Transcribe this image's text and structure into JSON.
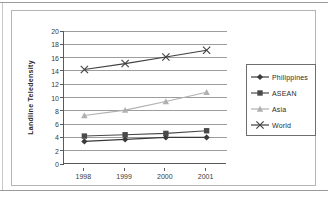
{
  "chart_data": {
    "type": "line",
    "title": "",
    "xlabel": "",
    "ylabel": "Landline Teledensity",
    "categories": [
      "1998",
      "1999",
      "2000",
      "2001"
    ],
    "ylim": [
      0,
      20
    ],
    "ytick_step": 2,
    "yticks": [
      "20",
      "18",
      "16",
      "14",
      "12",
      "10",
      "8",
      "6",
      "4",
      "2",
      "0"
    ],
    "grid": "horizontal",
    "legend_position": "right",
    "series": [
      {
        "name": "Philippines",
        "marker": "diamond",
        "color": "#3a3a3a",
        "values": [
          3.4,
          3.7,
          4.0,
          4.0
        ]
      },
      {
        "name": "ASEAN",
        "marker": "square",
        "color": "#4a4a4a",
        "values": [
          4.2,
          4.4,
          4.6,
          5.0
        ]
      },
      {
        "name": "Asia",
        "marker": "triangle",
        "color": "#b0b0b0",
        "values": [
          7.3,
          8.1,
          9.4,
          10.8
        ]
      },
      {
        "name": "World",
        "marker": "x",
        "color": "#3f3f3f",
        "values": [
          14.2,
          15.1,
          16.1,
          17.1
        ]
      }
    ]
  },
  "axis": {
    "y_title": "Landline Teledensity"
  },
  "legend": {
    "items": [
      {
        "label": "Philippines"
      },
      {
        "label": "ASEAN"
      },
      {
        "label": "Asia"
      },
      {
        "label": "World"
      }
    ]
  }
}
